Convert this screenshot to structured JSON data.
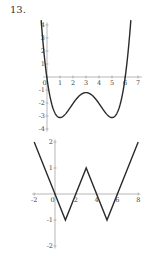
{
  "problem_number": "13.",
  "chart_data": [
    {
      "type": "line",
      "title": "",
      "xlabel": "",
      "ylabel": "",
      "description": "Quartic curve with roots near x=0 and x=6, local minima near (1,-3.1) and (5,-3.1), local maximum near (3,-1.2)",
      "formula_approx": "0.12*(x-3)^4 - 0.96*(x-3)^2 - 1.2",
      "x_domain": [
        -0.45,
        6.45
      ],
      "xlim": [
        0,
        7
      ],
      "ylim": [
        -4,
        4
      ],
      "x_ticks": [
        "0",
        "1",
        "2",
        "3",
        "4",
        "5",
        "6",
        "7"
      ],
      "y_ticks": [
        "4",
        "3",
        "2",
        "1",
        "-1",
        "-2",
        "-3",
        "-4"
      ],
      "key_points": [
        {
          "x": 0,
          "y": 0
        },
        {
          "x": 1,
          "y": -3.1
        },
        {
          "x": 3,
          "y": -1.2
        },
        {
          "x": 5,
          "y": -3.1
        },
        {
          "x": 6,
          "y": 0
        }
      ],
      "grid": false
    },
    {
      "type": "line",
      "title": "",
      "xlabel": "",
      "ylabel": "",
      "description": "Piecewise linear W-shaped graph",
      "x": [
        -2,
        1,
        3,
        5,
        8
      ],
      "y": [
        2,
        -1,
        1,
        -1,
        2
      ],
      "xlim": [
        -2,
        8
      ],
      "ylim": [
        -2,
        2
      ],
      "x_ticks": [
        "-2",
        "0",
        "2",
        "4",
        "6",
        "8"
      ],
      "y_ticks": [
        "2",
        "1",
        "-1",
        "-2"
      ],
      "grid": false
    }
  ],
  "layout": {
    "graph1": {
      "origin_x": 47,
      "origin_y": 77,
      "x_unit": 13,
      "y_unit": 13
    },
    "graph2": {
      "origin_x": 55,
      "origin_y": 194,
      "x_unit": 10.4,
      "y_unit": 26
    }
  }
}
